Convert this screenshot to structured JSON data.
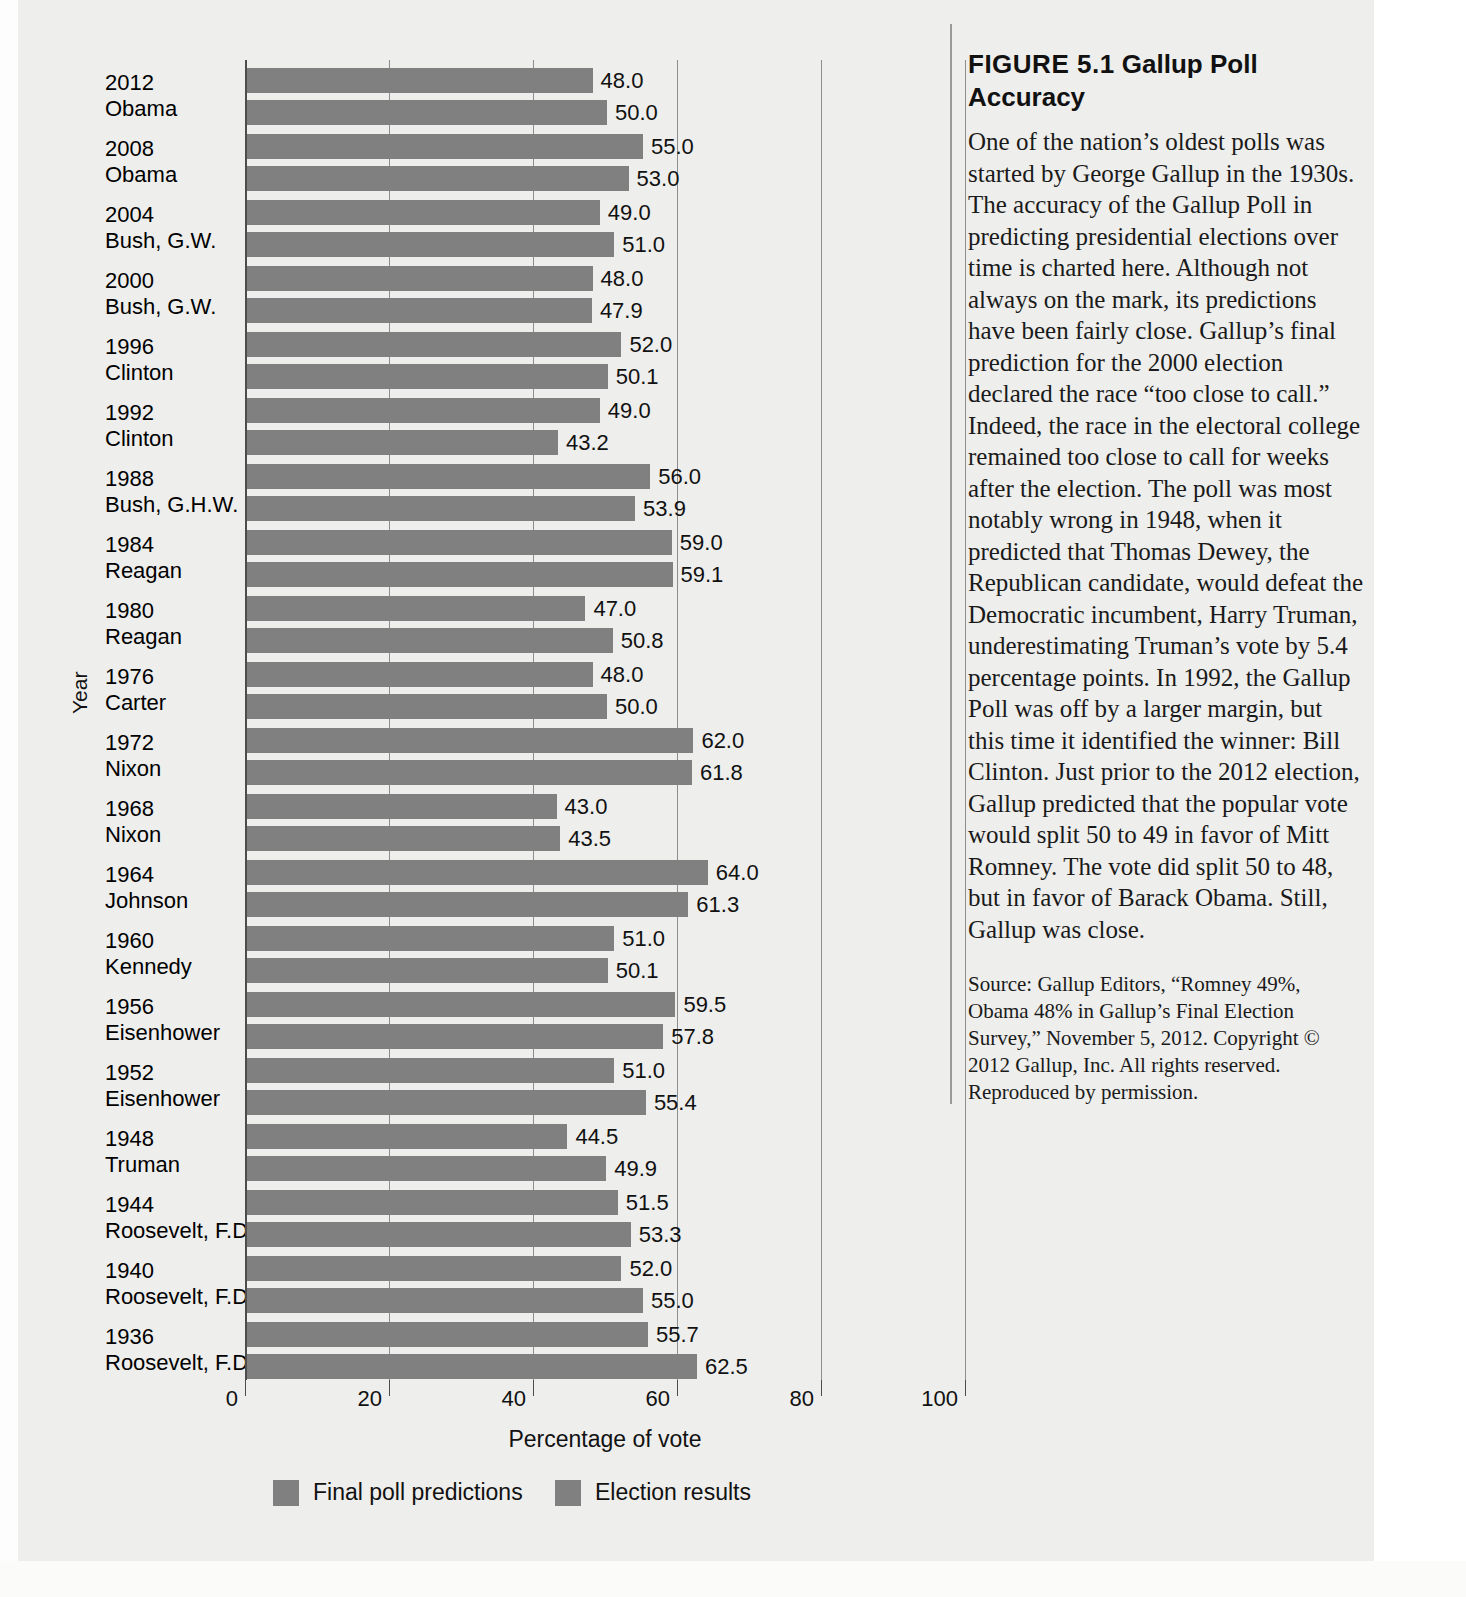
{
  "figure": {
    "title_prefix": "FIGURE 5.1",
    "title_main": "Gallup Poll Accuracy",
    "body": "One of the nation’s oldest polls was started by George Gallup in the 1930s. The accuracy of the Gallup Poll in predicting presidential elections over time is charted here. Although not always on the mark, its predictions have been fairly close. Gallup’s final prediction for the 2000 election declared the race “too close to call.” Indeed, the race in the electoral college remained too close to call for weeks after the election. The poll was most notably wrong in 1948, when it predicted that Thomas Dewey, the Republican candidate, would defeat the Democratic incumbent, Harry Truman, underestimating Truman’s vote by 5.4 percentage points. In 1992, the Gallup Poll was off by a larger margin, but this time it identified the winner: Bill Clinton. Just prior to the 2012 election, Gallup predicted that the popular vote would split 50 to 49 in favor of Mitt Romney. The vote did split 50 to 48, but in favor of Barack Obama. Still, Gallup was close.",
    "source": "Source: Gallup Editors, “Romney 49%, Obama 48% in Gallup’s Final Election Survey,” November 5, 2012. Copyright © 2012 Gallup, Inc. All rights reserved. Reproduced by permission."
  },
  "chart_data": {
    "type": "bar",
    "orientation": "horizontal",
    "title": "Gallup Poll Accuracy",
    "xlabel": "Percentage of vote",
    "ylabel": "Year",
    "xlim": [
      0,
      100
    ],
    "xticks": [
      0,
      20,
      40,
      60,
      80,
      100
    ],
    "xtick_labels": [
      "0",
      "20",
      "40",
      "60",
      "80",
      "100"
    ],
    "grid": true,
    "legend_position": "bottom",
    "bar_color": "#808080",
    "categories": [
      "2012 Obama",
      "2008 Obama",
      "2004 Bush, G.W.",
      "2000 Bush, G.W.",
      "1996 Clinton",
      "1992 Clinton",
      "1988 Bush, G.H.W.",
      "1984 Reagan",
      "1980 Reagan",
      "1976 Carter",
      "1972 Nixon",
      "1968 Nixon",
      "1964 Johnson",
      "1960 Kennedy",
      "1956 Eisenhower",
      "1952 Eisenhower",
      "1948 Truman",
      "1944 Roosevelt, F.D.",
      "1940 Roosevelt, F.D.",
      "1936 Roosevelt, F.D."
    ],
    "category_years": [
      "2012",
      "2008",
      "2004",
      "2000",
      "1996",
      "1992",
      "1988",
      "1984",
      "1980",
      "1976",
      "1972",
      "1968",
      "1964",
      "1960",
      "1956",
      "1952",
      "1948",
      "1944",
      "1940",
      "1936"
    ],
    "category_names": [
      "Obama",
      "Obama",
      "Bush, G.W.",
      "Bush, G.W.",
      "Clinton",
      "Clinton",
      "Bush, G.H.W.",
      "Reagan",
      "Reagan",
      "Carter",
      "Nixon",
      "Nixon",
      "Johnson",
      "Kennedy",
      "Eisenhower",
      "Eisenhower",
      "Truman",
      "Roosevelt, F.D.",
      "Roosevelt, F.D.",
      "Roosevelt, F.D."
    ],
    "series": [
      {
        "name": "Final poll predictions",
        "values": [
          48.0,
          55.0,
          49.0,
          48.0,
          52.0,
          49.0,
          56.0,
          59.0,
          47.0,
          48.0,
          62.0,
          43.0,
          64.0,
          51.0,
          59.5,
          51.0,
          44.5,
          51.5,
          52.0,
          55.7
        ],
        "labels": [
          "48.0",
          "55.0",
          "49.0",
          "48.0",
          "52.0",
          "49.0",
          "56.0",
          "59.0",
          "47.0",
          "48.0",
          "62.0",
          "43.0",
          "64.0",
          "51.0",
          "59.5",
          "51.0",
          "44.5",
          "51.5",
          "52.0",
          "55.7"
        ]
      },
      {
        "name": "Election results",
        "values": [
          50.0,
          53.0,
          51.0,
          47.9,
          50.1,
          43.2,
          53.9,
          59.1,
          50.8,
          50.0,
          61.8,
          43.5,
          61.3,
          50.1,
          57.8,
          55.4,
          49.9,
          53.3,
          55.0,
          62.5
        ],
        "labels": [
          "50.0",
          "53.0",
          "51.0",
          "47.9",
          "50.1",
          "43.2",
          "53.9",
          "59.1",
          "50.8",
          "50.0",
          "61.8",
          "43.5",
          "61.3",
          "50.1",
          "57.8",
          "55.4",
          "49.9",
          "53.3",
          "55.0",
          "62.5"
        ]
      }
    ]
  }
}
